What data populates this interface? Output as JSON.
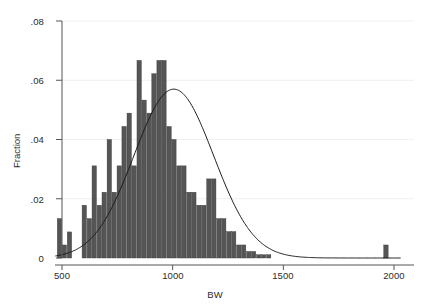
{
  "chart_data": {
    "type": "bar",
    "title": "",
    "subtitle": "",
    "xlabel": "BW",
    "ylabel": "Fraction",
    "xlim": [
      450,
      2030
    ],
    "ylim": [
      0,
      0.08
    ],
    "xticks": [
      500,
      1000,
      1500,
      2000
    ],
    "xtick_labels": [
      "500",
      "1000",
      "1500",
      "2000"
    ],
    "yticks": [
      0,
      0.02,
      0.04,
      0.06,
      0.08
    ],
    "ytick_labels": [
      "0",
      ".02",
      ".04",
      ".06",
      ".08"
    ],
    "grid": "faint-horizontal",
    "legend": "none",
    "bin_width": 22.5,
    "bar_color": "#555555",
    "bar_edge_color": "#3b3b3b",
    "overlay": {
      "type": "line",
      "name": "normal density",
      "color": "#1a1a1a",
      "mean": 1005,
      "sigma": 180,
      "peak_value": 0.057
    },
    "categories": [
      490,
      512,
      535,
      557,
      580,
      602,
      625,
      647,
      670,
      692,
      715,
      737,
      760,
      782,
      805,
      827,
      850,
      872,
      895,
      917,
      940,
      962,
      985,
      1007,
      1030,
      1052,
      1075,
      1097,
      1120,
      1142,
      1165,
      1187,
      1210,
      1232,
      1255,
      1277,
      1300,
      1322,
      1345,
      1367,
      1390,
      1412,
      1435,
      1965
    ],
    "values": [
      0.0133,
      0.0044,
      0.0088,
      0.0,
      0.0,
      0.0178,
      0.0133,
      0.0311,
      0.0178,
      0.0222,
      0.04,
      0.0222,
      0.0311,
      0.0444,
      0.0489,
      0.0311,
      0.0667,
      0.0533,
      0.0489,
      0.0622,
      0.0667,
      0.0667,
      0.0444,
      0.04,
      0.0311,
      0.0311,
      0.0222,
      0.0222,
      0.0178,
      0.0178,
      0.0267,
      0.0267,
      0.0133,
      0.0133,
      0.0089,
      0.0089,
      0.0044,
      0.0044,
      0.0022,
      0.0022,
      0.0011,
      0.0011,
      0.0011,
      0.0044
    ]
  },
  "axes": {
    "y_axis_name": "fraction-axis",
    "x_axis_name": "bw-axis"
  }
}
